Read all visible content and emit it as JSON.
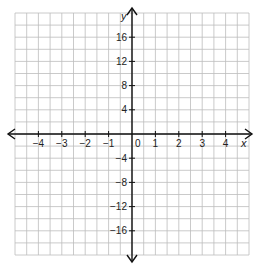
{
  "diagram": {
    "type": "coordinate-plane",
    "x_axis": {
      "label": "x",
      "ticks": [
        -4,
        -3,
        -2,
        -1,
        0,
        1,
        2,
        3,
        4
      ],
      "tick_labels": [
        "−4",
        "−3",
        "−2",
        "−1",
        "0",
        "1",
        "2",
        "3",
        "4"
      ],
      "grid_step": 0.5,
      "range": [
        -5,
        5
      ]
    },
    "y_axis": {
      "label": "y",
      "ticks": [
        16,
        12,
        8,
        4,
        -4,
        -8,
        -12,
        -16
      ],
      "tick_labels": [
        "16",
        "12",
        "8",
        "4",
        "−4",
        "−8",
        "−12",
        "−16"
      ],
      "grid_step": 2,
      "range": [
        -20,
        20
      ]
    },
    "origin_label": "0",
    "colors": {
      "grid": "#bdbdbd",
      "axis": "#111111",
      "background": "#ffffff"
    }
  }
}
